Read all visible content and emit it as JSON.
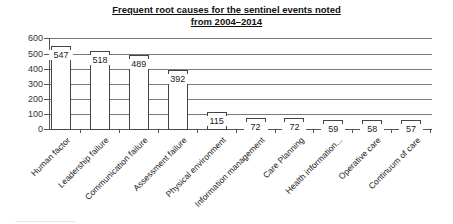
{
  "chart_data": {
    "type": "bar",
    "title_lines": [
      "Frequent root causes for the sentinel events noted",
      "from 2004–2014"
    ],
    "xlabel": "",
    "ylabel": "",
    "ylim": [
      0,
      600
    ],
    "yticks": [
      0,
      100,
      200,
      300,
      400,
      500,
      600
    ],
    "grid": true,
    "legend": null,
    "categories": [
      "Human factor",
      "Leadership failure",
      "Communication failure",
      "Assessment failure",
      "Physical environment",
      "Information management",
      "Care Planning",
      "Health information...",
      "Operative care",
      "Continuum of care"
    ],
    "values": [
      547,
      518,
      489,
      392,
      115,
      72,
      72,
      59,
      58,
      57
    ],
    "data_labels": [
      "547",
      "518",
      "489",
      "392",
      "115",
      "72",
      "72",
      "59",
      "58",
      "57"
    ]
  }
}
